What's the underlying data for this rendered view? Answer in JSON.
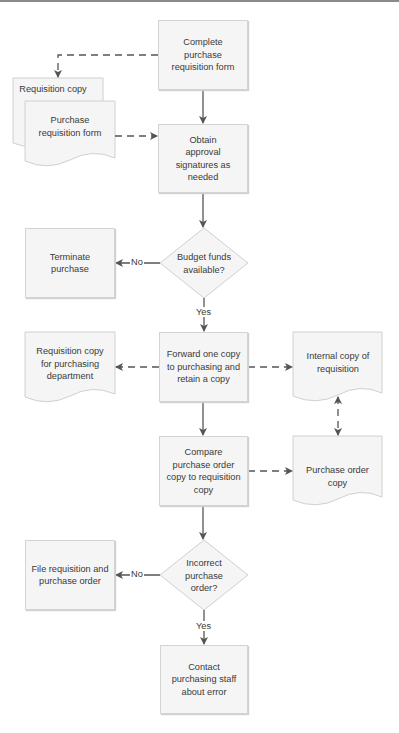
{
  "diagram": {
    "type": "flowchart",
    "nodes": {
      "complete_form": "Complete purchase requisition form",
      "requisition_copy": "Requisition copy",
      "purchase_req_form": "Purchase requisition form",
      "obtain_approval": "Obtain approval signatures as needed",
      "budget_decision": "Budget funds available?",
      "terminate": "Terminate purchase",
      "forward_copy": "Forward one copy to purchasing and retain a copy",
      "req_copy_purchasing": "Requisition copy for purchasing department",
      "internal_copy": "Internal copy of requisition",
      "compare": "Compare purchase order copy to requisition copy",
      "po_copy": "Purchase order copy",
      "incorrect_decision": "Incorrect purchase order?",
      "file": "File requisition and purchase order",
      "contact": "Contact purchasing staff about error"
    },
    "edge_labels": {
      "budget_no": "No",
      "budget_yes": "Yes",
      "incorrect_no": "No",
      "incorrect_yes": "Yes"
    },
    "edges": [
      {
        "from": "complete_form",
        "to": "obtain_approval",
        "style": "solid"
      },
      {
        "from": "complete_form",
        "to": "requisition_copy",
        "style": "dashed"
      },
      {
        "from": "purchase_req_form",
        "to": "obtain_approval",
        "style": "dashed"
      },
      {
        "from": "obtain_approval",
        "to": "budget_decision",
        "style": "solid"
      },
      {
        "from": "budget_decision",
        "to": "terminate",
        "style": "solid",
        "label": "No"
      },
      {
        "from": "budget_decision",
        "to": "forward_copy",
        "style": "solid",
        "label": "Yes"
      },
      {
        "from": "forward_copy",
        "to": "req_copy_purchasing",
        "style": "dashed"
      },
      {
        "from": "forward_copy",
        "to": "internal_copy",
        "style": "dashed"
      },
      {
        "from": "forward_copy",
        "to": "compare",
        "style": "solid"
      },
      {
        "from": "compare",
        "to": "po_copy",
        "style": "dashed"
      },
      {
        "from": "internal_copy",
        "to": "po_copy",
        "style": "dashed",
        "bidirectional": true
      },
      {
        "from": "compare",
        "to": "incorrect_decision",
        "style": "solid"
      },
      {
        "from": "incorrect_decision",
        "to": "file",
        "style": "solid",
        "label": "No"
      },
      {
        "from": "incorrect_decision",
        "to": "contact",
        "style": "solid",
        "label": "Yes"
      }
    ]
  },
  "colors": {
    "box_fill": "#f5f5f5",
    "box_border": "#d4d4d4",
    "line": "#555555",
    "text": "#3a3a3a"
  }
}
